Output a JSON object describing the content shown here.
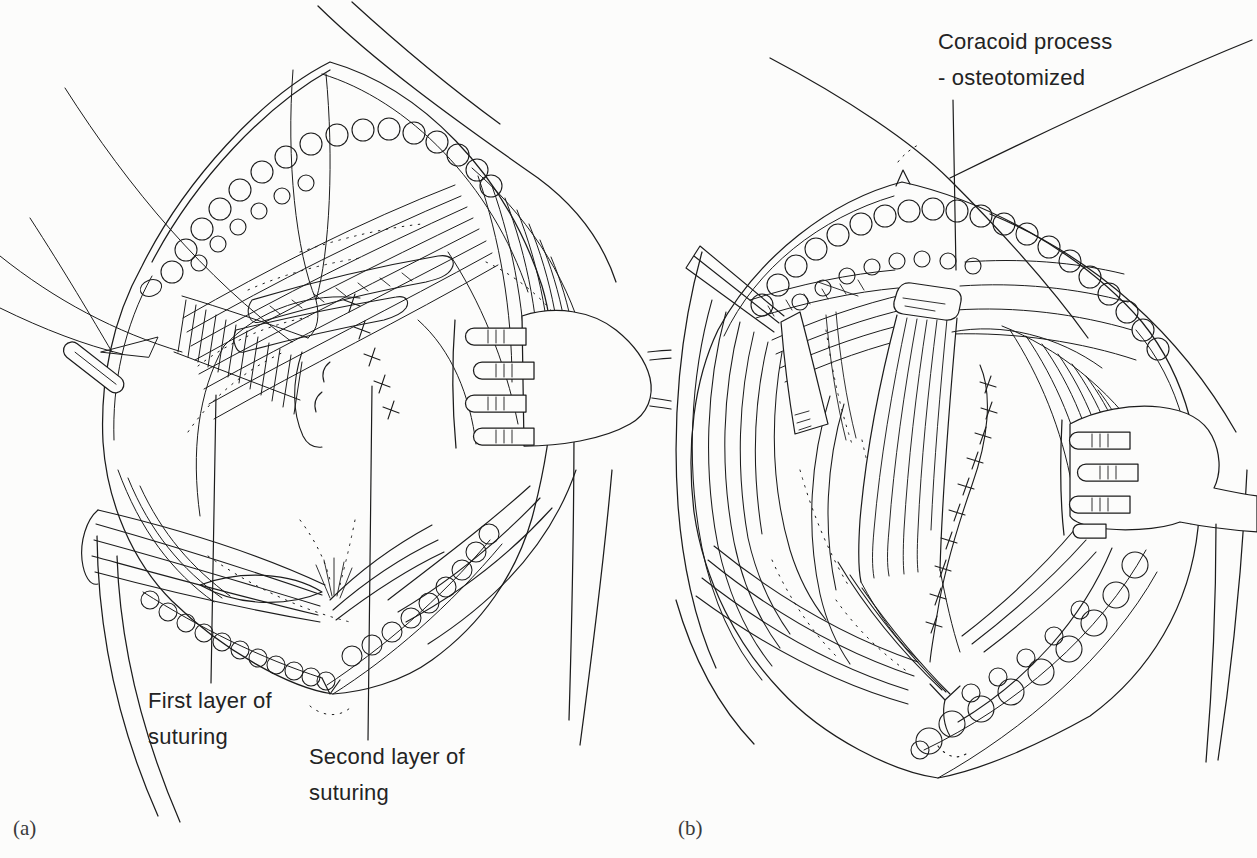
{
  "figure": {
    "kind": "surgical line illustration, two panels",
    "ink_color": "#1c1c1c",
    "paper_color": "#fcfcfb",
    "panel_a": {
      "label": "(a)",
      "annotations": {
        "first_layer": {
          "line1": "First layer of",
          "line2": "suturing"
        },
        "second_layer": {
          "line1": "Second layer of",
          "line2": "suturing"
        }
      }
    },
    "panel_b": {
      "label": "(b)",
      "annotations": {
        "coracoid": {
          "line1": "Coracoid process",
          "line2": "- osteotomized"
        }
      }
    }
  }
}
